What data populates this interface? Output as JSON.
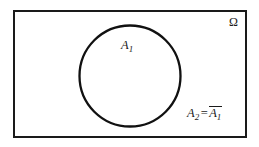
{
  "figure": {
    "type": "venn-diagram",
    "width": 259,
    "height": 147,
    "background_color": "#ffffff",
    "stroke_color": "#1a1a1a"
  },
  "universe_rectangle": {
    "name": "sample-space",
    "x": 13,
    "y": 10,
    "width": 234,
    "height": 128,
    "stroke_width": 2,
    "stroke_color": "#1a1a1a",
    "fill": "none"
  },
  "set_circle": {
    "name": "set-a1",
    "cx": 130,
    "cy": 76,
    "r": 51,
    "stroke_width": 2.3,
    "stroke_color": "#111111",
    "fill": "none"
  },
  "labels": {
    "omega": {
      "text": "Ω",
      "name": "omega-label",
      "x": 229,
      "y": 16
    },
    "set_inside": {
      "base": "A",
      "subscript": "1",
      "name": "a1-label",
      "x": 121,
      "y": 39
    },
    "set_outside": {
      "base_left": "A",
      "subscript_left": "2",
      "equals": "=",
      "base_right": "A",
      "subscript_right": "1",
      "overbar": true,
      "name": "a2-complement-label",
      "x": 187,
      "y": 107
    }
  }
}
